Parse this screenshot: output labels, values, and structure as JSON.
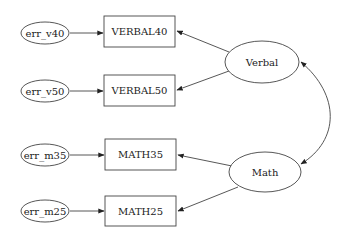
{
  "diagram": {
    "type": "path-diagram",
    "error_terms": [
      {
        "id": "err_v40",
        "label": "err_v40"
      },
      {
        "id": "err_v50",
        "label": "err_v50"
      },
      {
        "id": "err_m35",
        "label": "err_m35"
      },
      {
        "id": "err_m25",
        "label": "err_m25"
      }
    ],
    "observed": [
      {
        "id": "VERBAL40",
        "label": "VERBAL40"
      },
      {
        "id": "VERBAL50",
        "label": "VERBAL50"
      },
      {
        "id": "MATH35",
        "label": "MATH35"
      },
      {
        "id": "MATH25",
        "label": "MATH25"
      }
    ],
    "latent": [
      {
        "id": "Verbal",
        "label": "Verbal"
      },
      {
        "id": "Math",
        "label": "Math"
      }
    ],
    "edges": [
      {
        "from": "err_v40",
        "to": "VERBAL40",
        "kind": "directed"
      },
      {
        "from": "err_v50",
        "to": "VERBAL50",
        "kind": "directed"
      },
      {
        "from": "err_m35",
        "to": "MATH35",
        "kind": "directed"
      },
      {
        "from": "err_m25",
        "to": "MATH25",
        "kind": "directed"
      },
      {
        "from": "Verbal",
        "to": "VERBAL40",
        "kind": "directed"
      },
      {
        "from": "Verbal",
        "to": "VERBAL50",
        "kind": "directed"
      },
      {
        "from": "Math",
        "to": "MATH35",
        "kind": "directed"
      },
      {
        "from": "Math",
        "to": "MATH25",
        "kind": "directed"
      },
      {
        "from": "Verbal",
        "to": "Math",
        "kind": "bidirectional-covariance"
      }
    ]
  }
}
